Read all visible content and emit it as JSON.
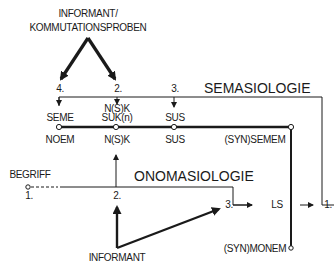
{
  "diagram": {
    "top_source": {
      "line1": "INFORMANT/",
      "line2": "KOMMUTATIONSPROBEN"
    },
    "semasiology": {
      "title": "SEMASIOLOGIE",
      "step_numbers": [
        "4.",
        "2.",
        "3."
      ],
      "upper_labels": {
        "seme": "SEME",
        "nsk_line1": "N(S)K",
        "nsk_line2": "SUK(n)",
        "sus": "SUS"
      },
      "lower_labels": {
        "noem": "NOEM",
        "nsk": "N(S)K",
        "sus": "SUS",
        "synsemem": "(SYN)SEMEM"
      },
      "end_label": "1."
    },
    "onomasiology": {
      "title": "ONOMASIOLOGIE",
      "start_label": "BEGRIFF",
      "step_numbers": [
        "1.",
        "2.",
        "3."
      ],
      "ls_label": "LS",
      "bottom_source": "INFORMANT",
      "synmonem": "(SYN)MONEM"
    },
    "colors": {
      "line": "#1a1a1a",
      "background": "#ffffff"
    }
  }
}
